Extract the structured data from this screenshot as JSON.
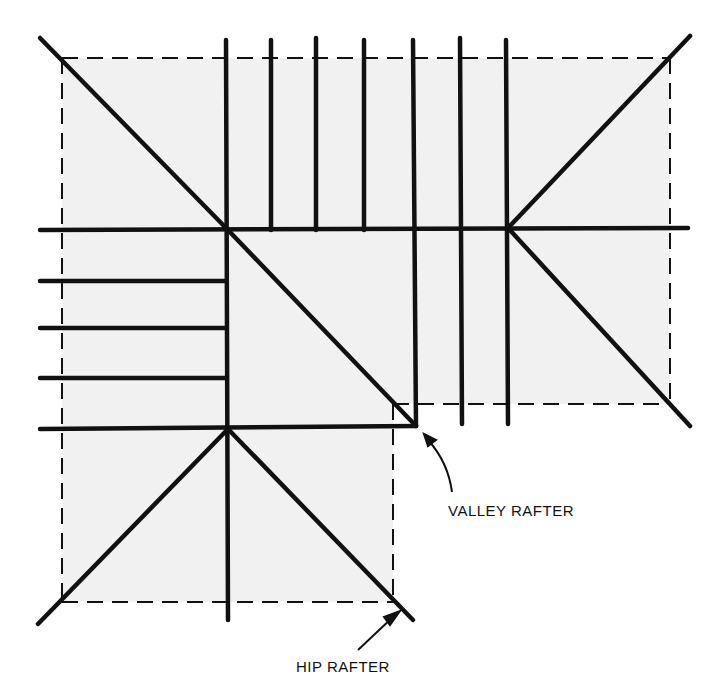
{
  "diagram": {
    "type": "roof framing plan",
    "colors": {
      "line": "#111111",
      "roof_fill": "#f1f1f1",
      "background": "#ffffff"
    },
    "labels": {
      "valley_rafter": "VALLEY RAFTER",
      "hip_rafter": "HIP RAFTER"
    },
    "caption": {
      "text": "",
      "note": "caption line clipped at bottom edge; illegible"
    }
  }
}
